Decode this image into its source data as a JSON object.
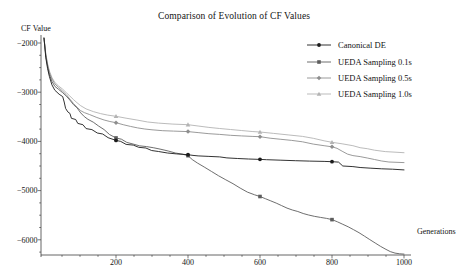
{
  "title": "Comparison of Evolution of CF Values",
  "axes": {
    "y_label": "CF Value",
    "x_label": "Generations"
  },
  "chart_data": {
    "type": "line",
    "title": "Comparison of Evolution of CF Values",
    "xlabel": "Generations",
    "ylabel": "CF Value",
    "xlim": [
      0,
      1020
    ],
    "ylim": [
      -6300,
      -1880
    ],
    "grid": false,
    "legend_position": "top-right-inside",
    "x_major_ticks": [
      200,
      400,
      600,
      800,
      1000
    ],
    "x_tick_labels": [
      "200",
      "400",
      "600",
      "800",
      "1000"
    ],
    "x_minor_step": 50,
    "y_major_ticks": [
      -2000,
      -3000,
      -4000,
      -5000,
      -6000
    ],
    "y_tick_labels": [
      "−2000",
      "−3000",
      "−4000",
      "−5000",
      "−6000"
    ],
    "y_minor_step": 250,
    "colors": {
      "axis": "#3f3f3f",
      "text": "#141414"
    },
    "series": [
      {
        "name": "Canonical DE",
        "color": "#1c1c1c",
        "marker": "circle",
        "marker_points": [
          [
            200,
            -3980
          ],
          [
            400,
            -4270
          ],
          [
            600,
            -4365
          ],
          [
            800,
            -4412
          ]
        ],
        "points": [
          [
            0,
            -1900
          ],
          [
            5,
            -2300
          ],
          [
            10,
            -2520
          ],
          [
            15,
            -2680
          ],
          [
            22,
            -2850
          ],
          [
            30,
            -2960
          ],
          [
            42,
            -3040
          ],
          [
            52,
            -3090
          ],
          [
            56,
            -3200
          ],
          [
            60,
            -3330
          ],
          [
            66,
            -3400
          ],
          [
            72,
            -3430
          ],
          [
            76,
            -3530
          ],
          [
            88,
            -3555
          ],
          [
            94,
            -3635
          ],
          [
            108,
            -3660
          ],
          [
            117,
            -3740
          ],
          [
            133,
            -3760
          ],
          [
            148,
            -3830
          ],
          [
            163,
            -3850
          ],
          [
            178,
            -3925
          ],
          [
            200,
            -3980
          ],
          [
            213,
            -4000
          ],
          [
            228,
            -4060
          ],
          [
            248,
            -4075
          ],
          [
            263,
            -4120
          ],
          [
            283,
            -4135
          ],
          [
            299,
            -4185
          ],
          [
            318,
            -4205
          ],
          [
            343,
            -4235
          ],
          [
            368,
            -4255
          ],
          [
            400,
            -4270
          ],
          [
            414,
            -4285
          ],
          [
            428,
            -4295
          ],
          [
            458,
            -4305
          ],
          [
            488,
            -4315
          ],
          [
            508,
            -4335
          ],
          [
            538,
            -4348
          ],
          [
            568,
            -4358
          ],
          [
            600,
            -4365
          ],
          [
            618,
            -4372
          ],
          [
            658,
            -4382
          ],
          [
            698,
            -4392
          ],
          [
            738,
            -4400
          ],
          [
            778,
            -4406
          ],
          [
            800,
            -4412
          ],
          [
            818,
            -4420
          ],
          [
            830,
            -4500
          ],
          [
            858,
            -4512
          ],
          [
            878,
            -4530
          ],
          [
            908,
            -4545
          ],
          [
            938,
            -4556
          ],
          [
            968,
            -4566
          ],
          [
            1000,
            -4580
          ]
        ]
      },
      {
        "name": "UEDA Sampling 0.1s",
        "color": "#5d5d5d",
        "marker": "square",
        "marker_points": [
          [
            200,
            -3930
          ],
          [
            400,
            -4290
          ],
          [
            600,
            -5120
          ],
          [
            800,
            -5590
          ]
        ],
        "points": [
          [
            0,
            -1900
          ],
          [
            5,
            -2260
          ],
          [
            10,
            -2480
          ],
          [
            15,
            -2640
          ],
          [
            22,
            -2780
          ],
          [
            30,
            -2880
          ],
          [
            40,
            -2940
          ],
          [
            52,
            -3010
          ],
          [
            62,
            -3080
          ],
          [
            72,
            -3160
          ],
          [
            82,
            -3255
          ],
          [
            92,
            -3320
          ],
          [
            102,
            -3420
          ],
          [
            112,
            -3495
          ],
          [
            122,
            -3550
          ],
          [
            137,
            -3610
          ],
          [
            152,
            -3690
          ],
          [
            167,
            -3760
          ],
          [
            182,
            -3860
          ],
          [
            200,
            -3930
          ],
          [
            215,
            -3955
          ],
          [
            230,
            -4020
          ],
          [
            248,
            -4055
          ],
          [
            265,
            -4090
          ],
          [
            285,
            -4105
          ],
          [
            305,
            -4130
          ],
          [
            325,
            -4160
          ],
          [
            345,
            -4195
          ],
          [
            365,
            -4235
          ],
          [
            385,
            -4260
          ],
          [
            400,
            -4290
          ],
          [
            412,
            -4370
          ],
          [
            426,
            -4440
          ],
          [
            445,
            -4520
          ],
          [
            465,
            -4610
          ],
          [
            485,
            -4700
          ],
          [
            505,
            -4780
          ],
          [
            525,
            -4860
          ],
          [
            545,
            -4950
          ],
          [
            565,
            -5030
          ],
          [
            585,
            -5085
          ],
          [
            600,
            -5120
          ],
          [
            615,
            -5165
          ],
          [
            630,
            -5210
          ],
          [
            645,
            -5255
          ],
          [
            660,
            -5305
          ],
          [
            675,
            -5355
          ],
          [
            690,
            -5395
          ],
          [
            705,
            -5425
          ],
          [
            720,
            -5465
          ],
          [
            735,
            -5495
          ],
          [
            752,
            -5525
          ],
          [
            768,
            -5545
          ],
          [
            785,
            -5565
          ],
          [
            800,
            -5590
          ],
          [
            815,
            -5635
          ],
          [
            830,
            -5685
          ],
          [
            845,
            -5735
          ],
          [
            860,
            -5795
          ],
          [
            875,
            -5855
          ],
          [
            890,
            -5925
          ],
          [
            905,
            -5995
          ],
          [
            920,
            -6065
          ],
          [
            935,
            -6135
          ],
          [
            950,
            -6195
          ],
          [
            962,
            -6240
          ],
          [
            975,
            -6270
          ],
          [
            988,
            -6285
          ],
          [
            1000,
            -6290
          ]
        ]
      },
      {
        "name": "UEDA Sampling 0.5s",
        "color": "#8e8e8e",
        "marker": "diamond",
        "marker_points": [
          [
            200,
            -3620
          ],
          [
            400,
            -3800
          ],
          [
            600,
            -3905
          ],
          [
            800,
            -4110
          ]
        ],
        "points": [
          [
            0,
            -1900
          ],
          [
            5,
            -2240
          ],
          [
            10,
            -2450
          ],
          [
            15,
            -2600
          ],
          [
            22,
            -2730
          ],
          [
            30,
            -2830
          ],
          [
            40,
            -2900
          ],
          [
            52,
            -2980
          ],
          [
            62,
            -3050
          ],
          [
            72,
            -3140
          ],
          [
            82,
            -3230
          ],
          [
            92,
            -3305
          ],
          [
            102,
            -3375
          ],
          [
            112,
            -3415
          ],
          [
            127,
            -3455
          ],
          [
            147,
            -3515
          ],
          [
            167,
            -3565
          ],
          [
            183,
            -3595
          ],
          [
            200,
            -3620
          ],
          [
            220,
            -3660
          ],
          [
            240,
            -3695
          ],
          [
            260,
            -3725
          ],
          [
            280,
            -3748
          ],
          [
            300,
            -3765
          ],
          [
            330,
            -3782
          ],
          [
            360,
            -3790
          ],
          [
            400,
            -3800
          ],
          [
            428,
            -3822
          ],
          [
            458,
            -3843
          ],
          [
            488,
            -3858
          ],
          [
            518,
            -3875
          ],
          [
            548,
            -3888
          ],
          [
            578,
            -3898
          ],
          [
            600,
            -3905
          ],
          [
            628,
            -3935
          ],
          [
            658,
            -3958
          ],
          [
            688,
            -3980
          ],
          [
            718,
            -4008
          ],
          [
            748,
            -4055
          ],
          [
            778,
            -4088
          ],
          [
            800,
            -4110
          ],
          [
            814,
            -4140
          ],
          [
            828,
            -4200
          ],
          [
            843,
            -4258
          ],
          [
            858,
            -4288
          ],
          [
            878,
            -4308
          ],
          [
            898,
            -4338
          ],
          [
            918,
            -4368
          ],
          [
            938,
            -4398
          ],
          [
            958,
            -4418
          ],
          [
            1000,
            -4430
          ]
        ]
      },
      {
        "name": "UEDA Sampling 1.0s",
        "color": "#b3b3b3",
        "marker": "triangle",
        "marker_points": [
          [
            200,
            -3490
          ],
          [
            400,
            -3660
          ],
          [
            600,
            -3808
          ],
          [
            800,
            -4018
          ]
        ],
        "points": [
          [
            0,
            -1900
          ],
          [
            5,
            -2220
          ],
          [
            10,
            -2420
          ],
          [
            15,
            -2570
          ],
          [
            22,
            -2700
          ],
          [
            30,
            -2800
          ],
          [
            40,
            -2870
          ],
          [
            52,
            -2940
          ],
          [
            62,
            -3010
          ],
          [
            72,
            -3080
          ],
          [
            82,
            -3150
          ],
          [
            92,
            -3215
          ],
          [
            102,
            -3275
          ],
          [
            117,
            -3340
          ],
          [
            137,
            -3395
          ],
          [
            157,
            -3435
          ],
          [
            177,
            -3465
          ],
          [
            200,
            -3490
          ],
          [
            228,
            -3528
          ],
          [
            258,
            -3565
          ],
          [
            288,
            -3605
          ],
          [
            318,
            -3628
          ],
          [
            358,
            -3648
          ],
          [
            400,
            -3660
          ],
          [
            428,
            -3688
          ],
          [
            458,
            -3715
          ],
          [
            488,
            -3738
          ],
          [
            518,
            -3758
          ],
          [
            548,
            -3778
          ],
          [
            578,
            -3798
          ],
          [
            600,
            -3808
          ],
          [
            638,
            -3838
          ],
          [
            678,
            -3868
          ],
          [
            718,
            -3898
          ],
          [
            748,
            -3938
          ],
          [
            778,
            -3988
          ],
          [
            800,
            -4018
          ],
          [
            828,
            -4048
          ],
          [
            858,
            -4088
          ],
          [
            878,
            -4128
          ],
          [
            898,
            -4148
          ],
          [
            918,
            -4178
          ],
          [
            948,
            -4208
          ],
          [
            1000,
            -4230
          ]
        ]
      }
    ]
  }
}
